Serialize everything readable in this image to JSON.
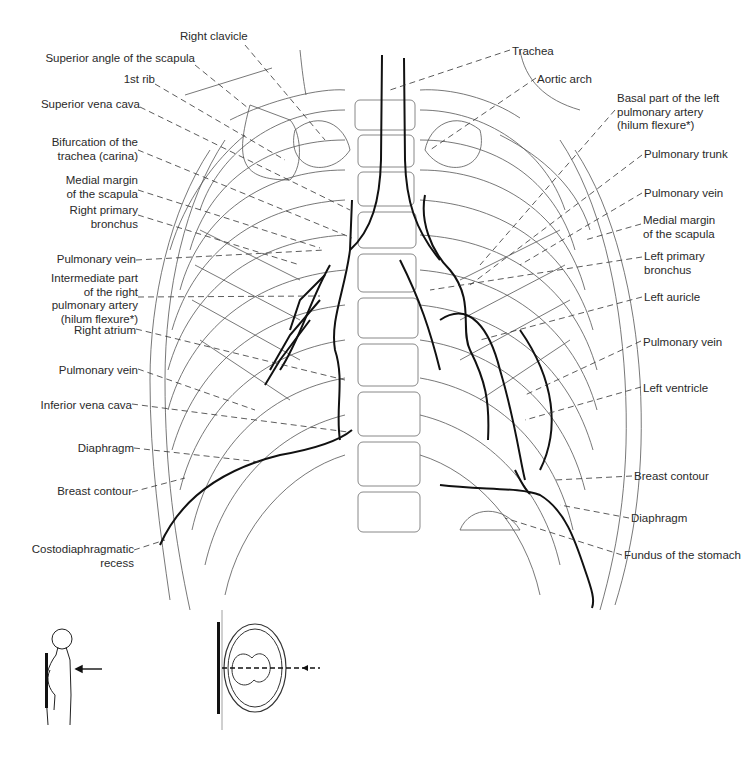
{
  "figure": {
    "labels_left": [
      {
        "id": "right-clavicle",
        "text": "Right clavicle",
        "x": 180,
        "y": 35,
        "w": 95,
        "align": "l"
      },
      {
        "id": "superior-angle-scapula",
        "text": "Superior angle of the scapula",
        "x": 20,
        "y": 57,
        "w": 175,
        "align": "r"
      },
      {
        "id": "first-rib",
        "text": "1st rib",
        "x": 100,
        "y": 77,
        "w": 55,
        "align": "r"
      },
      {
        "id": "superior-vena-cava",
        "text": "Superior vena cava",
        "x": 20,
        "y": 102,
        "w": 120,
        "align": "r"
      },
      {
        "id": "carina",
        "text": "Bifurcation of the\ntrachea (carina)",
        "x": 20,
        "y": 137,
        "w": 118,
        "align": "r"
      },
      {
        "id": "medial-margin-scapula-right",
        "text": "Medial margin\nof the scapula",
        "x": 20,
        "y": 175,
        "w": 118,
        "align": "r"
      },
      {
        "id": "right-primary-bronchus",
        "text": "Right primary\nbronchus",
        "x": 20,
        "y": 205,
        "w": 118,
        "align": "r"
      },
      {
        "id": "pulmonary-vein-right-upper",
        "text": "Pulmonary vein",
        "x": 20,
        "y": 253,
        "w": 116,
        "align": "r"
      },
      {
        "id": "intermediate-right-pa",
        "text": "Intermediate part\nof the right\npulmonary artery\n(hilum flexure*)",
        "x": 20,
        "y": 272,
        "w": 118,
        "align": "r"
      },
      {
        "id": "right-atrium",
        "text": "Right atrium",
        "x": 20,
        "y": 324,
        "w": 116,
        "align": "r"
      },
      {
        "id": "pulmonary-vein-right-lower",
        "text": "Pulmonary vein",
        "x": 20,
        "y": 364,
        "w": 118,
        "align": "r"
      },
      {
        "id": "inferior-vena-cava",
        "text": "Inferior vena cava",
        "x": 20,
        "y": 399,
        "w": 112,
        "align": "r"
      },
      {
        "id": "diaphragm-right",
        "text": "Diaphragm",
        "x": 20,
        "y": 443,
        "w": 114,
        "align": "r"
      },
      {
        "id": "breast-contour-right",
        "text": "Breast contour",
        "x": 20,
        "y": 485,
        "w": 112,
        "align": "r"
      },
      {
        "id": "costodiaphragmatic-recess",
        "text": "Costodiaphragmatic\nrecess",
        "x": 20,
        "y": 543,
        "w": 114,
        "align": "r"
      }
    ],
    "labels_right": [
      {
        "id": "trachea",
        "text": "Trachea",
        "x": 512,
        "y": 45,
        "w": 80,
        "align": "l"
      },
      {
        "id": "aortic-arch",
        "text": "Aortic arch",
        "x": 537,
        "y": 73,
        "w": 90,
        "align": "l"
      },
      {
        "id": "basal-left-pa",
        "text": "Basal part of the left\npulmonary artery\n(hilum flexure*)",
        "x": 617,
        "y": 92,
        "w": 130,
        "align": "l"
      },
      {
        "id": "pulmonary-trunk",
        "text": "Pulmonary trunk",
        "x": 644,
        "y": 148,
        "w": 105,
        "align": "l"
      },
      {
        "id": "pulmonary-vein-left-upper",
        "text": "Pulmonary vein",
        "x": 644,
        "y": 187,
        "w": 105,
        "align": "l"
      },
      {
        "id": "medial-margin-scapula-left",
        "text": "Medial margin\nof the scapula",
        "x": 643,
        "y": 214,
        "w": 105,
        "align": "l"
      },
      {
        "id": "left-primary-bronchus",
        "text": "Left primary\nbronchus",
        "x": 644,
        "y": 250,
        "w": 105,
        "align": "l"
      },
      {
        "id": "left-auricle",
        "text": "Left auricle",
        "x": 644,
        "y": 291,
        "w": 105,
        "align": "l"
      },
      {
        "id": "pulmonary-vein-left-lower",
        "text": "Pulmonary vein",
        "x": 643,
        "y": 336,
        "w": 105,
        "align": "l"
      },
      {
        "id": "left-ventricle",
        "text": "Left ventricle",
        "x": 643,
        "y": 382,
        "w": 105,
        "align": "l"
      },
      {
        "id": "breast-contour-left",
        "text": "Breast contour",
        "x": 634,
        "y": 470,
        "w": 105,
        "align": "l"
      },
      {
        "id": "diaphragm-left",
        "text": "Diaphragm",
        "x": 631,
        "y": 512,
        "w": 100,
        "align": "l"
      },
      {
        "id": "fundus-stomach",
        "text": "Fundus of the stomach",
        "x": 624,
        "y": 549,
        "w": 127,
        "align": "l"
      }
    ],
    "insets": [
      {
        "id": "patient-position-inset",
        "description": "Patient standing, chest against detector, arrow indicating beam direction (posteroanterior)"
      },
      {
        "id": "axial-section-inset",
        "description": "Axial cross-section of thorax with detector plate and dashed beam path"
      }
    ],
    "footnote_marker": "*"
  }
}
